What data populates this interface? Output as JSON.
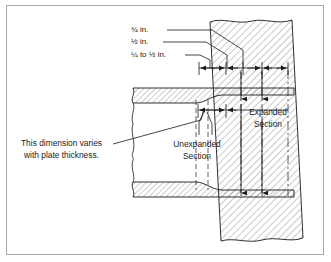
{
  "figure": {
    "border_color": "#a8a8a8",
    "line_color": "#1a1a1a",
    "hatch_color": "#4a4a4a",
    "background": "#ffffff"
  },
  "callouts": {
    "dim_top": "¾ in.",
    "dim_middle": "½ in.",
    "dim_bottom": "¼ to ½ in."
  },
  "labels": {
    "expanded_line1": "Expanded",
    "expanded_line2": "Section",
    "unexpanded_line1": "Unexpanded",
    "unexpanded_line2": "Section",
    "note_line1": "This dimension varies",
    "note_line2": "with plate thickness."
  },
  "annotations": {
    "dimension_line_arrow_count": 6,
    "vertical_arrow_count": 3,
    "leader_count": 3
  }
}
